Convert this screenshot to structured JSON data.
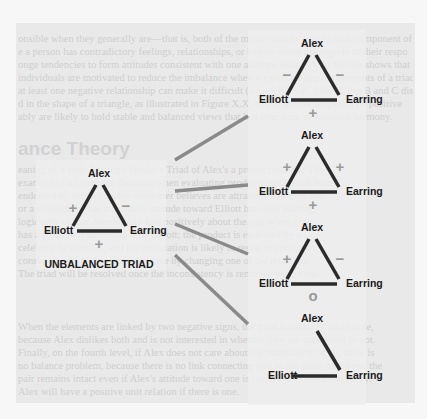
{
  "background": {
    "heading_fragment": "ance Theory",
    "panel_color": "#e9e9e9",
    "text_lines_top": [
      "onsible when they generally are—that is, both of the major contributors in each component of",
      "e a person has contradictory feelings, relationships, or beliefs about the objects of their respo",
      "onge tendencies to form attitudes consistent with one another. Research by Heider shows that",
      "individuals are motivated to reduce the imbalance when it exists among the elements of a triad",
      "at least one negative relationship can make it difficult (e.g., A likes B, likes C, but B and C dislike",
      "d in the shape of a triangle, as illustrated in Figure X.X, where relationships can be positive",
      "ably are likely to hold stable and balanced views that last over time to maintain harmony."
    ],
    "text_lines_middle": [
      "eaning of a Jody Ferring's Heider's Triad of Alex's a product named? The",
      "example of a consumer decision when evaluating products and brands based",
      "endorsed by celebrities the consumer believes are attractive and credible.",
      "or a product; he has a negative attitude toward Elliott but likes Earring.",
      "logic tells us that Alex should feel positively about the pair when both",
      "has a positive relationship with Elliott; the product is endorsed by a",
      "celebrity he admires, and the association is likely to result in purchase.",
      "consumer will try to restore balance by changing one of the relations.",
      "The triad will be resolved once the inconsistency is removed from view."
    ],
    "text_lines_bottom": [
      "When the elements are linked by two negative signs, the triad is balanced and stable,",
      "because Alex dislikes both and is not interested in whether they are connected or not.",
      "Finally, on the fourth level, if Alex does not care about the relationship at all, there is",
      "no balance problem, because there is no link connecting him to the other members; the",
      "pair remains intact even if Alex's attitude toward one is neutral or nonexistent today.",
      "Alex will have a positive unit relation if there is one."
    ]
  },
  "main_triad": {
    "nodes": {
      "top": "Alex",
      "left": "Elliott",
      "right": "Earring"
    },
    "signs": {
      "alex_elliott": "+",
      "alex_earring": "−",
      "elliott_earring": "+"
    },
    "caption": "UNBALANCED TRIAD"
  },
  "resolutions": [
    {
      "nodes": {
        "top": "Alex",
        "left": "Elliott",
        "right": "Earring"
      },
      "signs": {
        "alex_elliott": "−",
        "alex_earring": "−",
        "elliott_earring": "+"
      }
    },
    {
      "nodes": {
        "top": "Alex",
        "left": "Elliott",
        "right": "Earring"
      },
      "signs": {
        "alex_elliott": "+",
        "alex_earring": "+",
        "elliott_earring": "+"
      }
    },
    {
      "nodes": {
        "top": "Alex",
        "left": "Elliott",
        "right": "Earring"
      },
      "signs": {
        "alex_elliott": "+",
        "alex_earring": "−",
        "elliott_earring": "o"
      }
    },
    {
      "nodes": {
        "top": "Alex",
        "left": "Elliott",
        "right": "Earring"
      },
      "signs": {
        "alex_elliott": "",
        "alex_earring": "",
        "elliott_earring": ""
      }
    }
  ],
  "colors": {
    "edge": "#2b2b2b",
    "connector": "#8a8a8a",
    "sign": "#9a9a9a",
    "label": "#1a1a1a"
  }
}
